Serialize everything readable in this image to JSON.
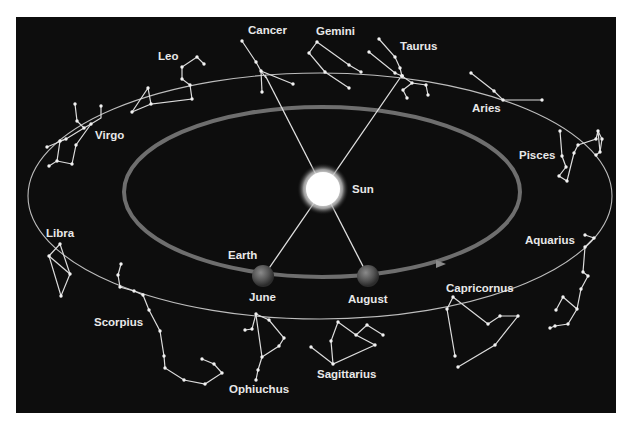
{
  "diagram": {
    "colors": {
      "background": "#0d0d0d",
      "page": "#ffffff",
      "line": "#dcdcdc",
      "orbit": "#6a6a6a",
      "label": "#e8e8e8"
    },
    "sun": {
      "label": "Sun"
    },
    "earth": {
      "label": "Earth",
      "positions": [
        {
          "label": "June",
          "sightline_to": "Taurus"
        },
        {
          "label": "August",
          "sightline_to": "Cancer"
        }
      ]
    },
    "constellations": [
      {
        "name": "Cancer"
      },
      {
        "name": "Gemini"
      },
      {
        "name": "Taurus"
      },
      {
        "name": "Leo"
      },
      {
        "name": "Aries"
      },
      {
        "name": "Virgo"
      },
      {
        "name": "Pisces"
      },
      {
        "name": "Libra"
      },
      {
        "name": "Aquarius"
      },
      {
        "name": "Capricornus"
      },
      {
        "name": "Scorpius"
      },
      {
        "name": "Sagittarius"
      },
      {
        "name": "Ophiuchus"
      }
    ]
  }
}
